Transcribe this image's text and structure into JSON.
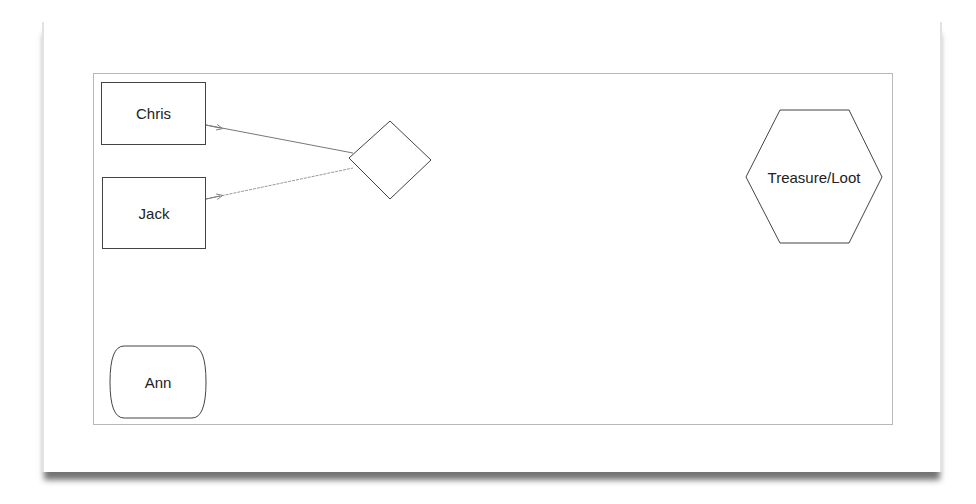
{
  "diagram": {
    "nodes": [
      {
        "id": "chris",
        "label": "Chris",
        "shape": "rectangle"
      },
      {
        "id": "jack",
        "label": "Jack",
        "shape": "rectangle"
      },
      {
        "id": "decision",
        "label": "",
        "shape": "diamond"
      },
      {
        "id": "treasure",
        "label": "Treasure/Loot",
        "shape": "hexagon"
      },
      {
        "id": "ann",
        "label": "Ann",
        "shape": "rounded-rectangle"
      }
    ],
    "edges": [
      {
        "from": "chris",
        "to": "decision",
        "style": "thin-line",
        "arrowhead": "open-arrow-near-source"
      },
      {
        "from": "jack",
        "to": "decision",
        "style": "thin-line",
        "arrowhead": "open-arrow-near-source"
      }
    ],
    "colors": {
      "stroke": "#444444",
      "edge": "#777777",
      "frame": "#b8b8b8",
      "text": "#222222"
    }
  }
}
